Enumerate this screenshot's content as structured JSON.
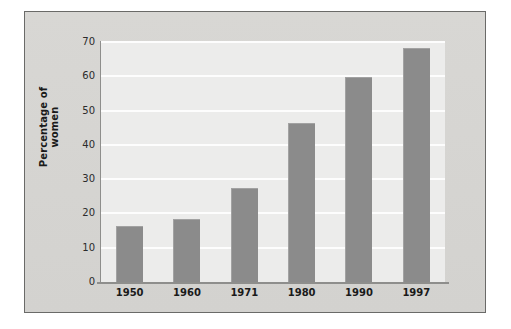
{
  "figure": {
    "panel_color": "#d6d5d2",
    "border_color": "#6a6a68",
    "plot_background": "#ececeb",
    "gridline_color": "#fdfdfd",
    "bar_color": "#8b8b8b",
    "axis_color": "#8e8e8c"
  },
  "chart_data": {
    "type": "bar",
    "title": "",
    "xlabel": "",
    "ylabel": "Percentage of women",
    "categories": [
      "1950",
      "1960",
      "1971",
      "1980",
      "1990",
      "1997"
    ],
    "values": [
      16,
      18,
      27,
      46,
      59.5,
      68
    ],
    "ylim": [
      0,
      70
    ],
    "ytick_labels": [
      "0",
      "10",
      "20",
      "30",
      "40",
      "50",
      "60",
      "70"
    ],
    "ytick_values": [
      0,
      10,
      20,
      30,
      40,
      50,
      60,
      70
    ],
    "grid": true,
    "grid_axis": "y",
    "legend": false,
    "legend_position": "none",
    "series": [
      {
        "name": "Percentage of women",
        "values": [
          16,
          18,
          27,
          46,
          59.5,
          68
        ]
      }
    ]
  }
}
